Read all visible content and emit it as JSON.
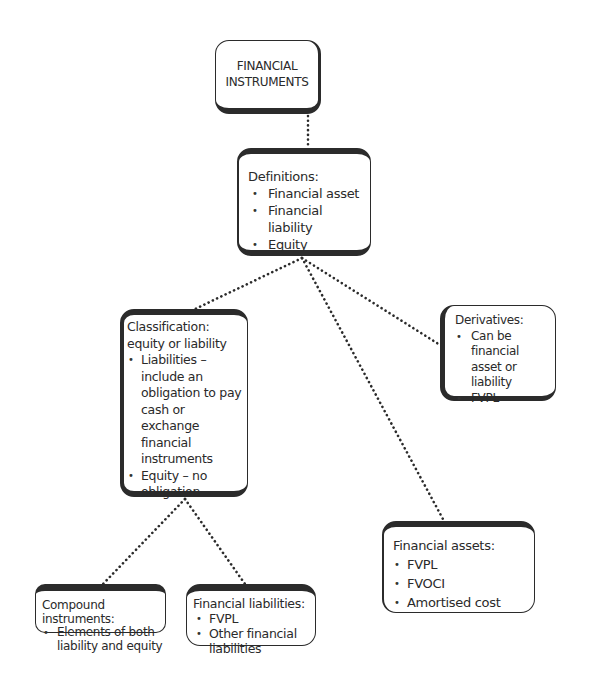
{
  "diagram": {
    "type": "hierarchy",
    "root": {
      "title_line1": "FINANCIAL",
      "title_line2": "INSTRUMENTS"
    },
    "definitions": {
      "title": "Definitions:",
      "items": [
        "Financial asset",
        "Financial liability",
        "Equity"
      ]
    },
    "classification": {
      "title_line1": "Classification:",
      "title_line2": "equity or liability",
      "items": [
        "Liabilities – include an obligation to pay cash or exchange financial instruments",
        "Equity – no obligation"
      ]
    },
    "derivatives": {
      "title": "Derivatives:",
      "items": [
        "Can be financial asset or liability",
        "FVPL"
      ]
    },
    "compound": {
      "title": "Compound instruments:",
      "items": [
        "Elements of both liability and equity"
      ]
    },
    "financial_liabilities": {
      "title": "Financial liabilities:",
      "items": [
        "FVPL",
        "Other financial liabilities"
      ]
    },
    "financial_assets": {
      "title": "Financial assets:",
      "items": [
        "FVPL",
        "FVOCI",
        "Amortised cost"
      ]
    },
    "edges": [
      {
        "from": "root",
        "to": "definitions"
      },
      {
        "from": "definitions",
        "to": "classification"
      },
      {
        "from": "definitions",
        "to": "derivatives"
      },
      {
        "from": "definitions",
        "to": "financial_assets"
      },
      {
        "from": "classification",
        "to": "compound"
      },
      {
        "from": "classification",
        "to": "financial_liabilities"
      }
    ],
    "colors": {
      "border": "#2b2b2b",
      "text": "#2a2a2a",
      "connector": "#2b2b2b",
      "background": "#ffffff"
    }
  }
}
